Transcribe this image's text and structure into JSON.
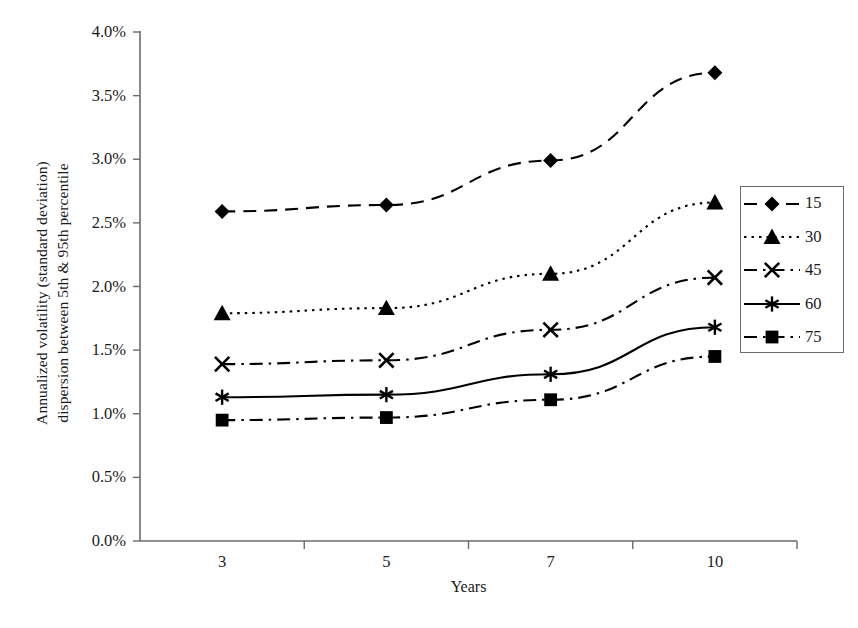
{
  "chart_data": {
    "type": "line",
    "title": "",
    "xlabel": "Years",
    "ylabel": "Annualized volatility (standard deviation)\ndispersion between 5th & 95th percentile",
    "categories": [
      "3",
      "5",
      "7",
      "10"
    ],
    "ytick_labels": [
      "0.0%",
      "0.5%",
      "1.0%",
      "1.5%",
      "2.0%",
      "2.5%",
      "3.0%",
      "3.5%",
      "4.0%"
    ],
    "ytick_values": [
      0.0,
      0.5,
      1.0,
      1.5,
      2.0,
      2.5,
      3.0,
      3.5,
      4.0
    ],
    "ylim": [
      0.0,
      4.0
    ],
    "grid": false,
    "legend_position": "right",
    "series": [
      {
        "name": "15",
        "values": [
          2.59,
          2.64,
          2.99,
          3.68
        ],
        "marker": "diamond",
        "dash": "dashed",
        "color": "#000000"
      },
      {
        "name": "30",
        "values": [
          1.79,
          1.83,
          2.1,
          2.66
        ],
        "marker": "triangle",
        "dash": "dotted",
        "color": "#000000"
      },
      {
        "name": "45",
        "values": [
          1.39,
          1.42,
          1.66,
          2.07
        ],
        "marker": "x",
        "dash": "dashdot",
        "color": "#000000"
      },
      {
        "name": "60",
        "values": [
          1.13,
          1.15,
          1.31,
          1.68
        ],
        "marker": "asterisk",
        "dash": "solid",
        "color": "#000000"
      },
      {
        "name": "75",
        "values": [
          0.95,
          0.97,
          1.11,
          1.45
        ],
        "marker": "square",
        "dash": "dashdotdot",
        "color": "#000000"
      }
    ]
  },
  "axis": {
    "line_color": "#6b6b6b",
    "text_color": "#1a1a1a"
  }
}
